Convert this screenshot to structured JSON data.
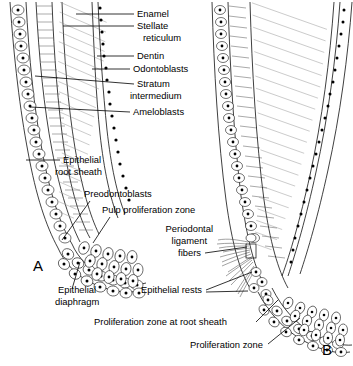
{
  "figure": {
    "background": "#ffffff",
    "ink": "#000000"
  },
  "panels": [
    {
      "id": "A",
      "label": "A",
      "x": 33,
      "y": 271
    },
    {
      "id": "B",
      "label": "B",
      "x": 322,
      "y": 355
    }
  ],
  "labels": [
    {
      "id": "enamel",
      "text": "Enamel",
      "x": 137,
      "y": 17,
      "anchor": "start"
    },
    {
      "id": "stellate",
      "text": "Stellate",
      "x": 137,
      "y": 29,
      "anchor": "start"
    },
    {
      "id": "reticulum",
      "text": "reticulum",
      "x": 143,
      "y": 41,
      "anchor": "start"
    },
    {
      "id": "dentin",
      "text": "Dentin",
      "x": 137,
      "y": 59,
      "anchor": "start"
    },
    {
      "id": "odontoblasts",
      "text": "Odontoblasts",
      "x": 133,
      "y": 72,
      "anchor": "start"
    },
    {
      "id": "stratum",
      "text": "Stratum",
      "x": 137,
      "y": 87,
      "anchor": "start"
    },
    {
      "id": "intermedium",
      "text": "intermedium",
      "x": 130,
      "y": 99,
      "anchor": "start"
    },
    {
      "id": "ameloblasts",
      "text": "Ameloblasts",
      "x": 133,
      "y": 115,
      "anchor": "start"
    },
    {
      "id": "epith-root-1",
      "text": "Epithelial",
      "x": 63,
      "y": 163,
      "anchor": "start"
    },
    {
      "id": "epith-root-2",
      "text": "root sheath",
      "x": 55,
      "y": 175,
      "anchor": "start"
    },
    {
      "id": "preodontoblasts",
      "text": "Preodontoblasts",
      "x": 84,
      "y": 197,
      "anchor": "start"
    },
    {
      "id": "pulp-prolif",
      "text": "Pulp proliferation zone",
      "x": 102,
      "y": 213,
      "anchor": "start"
    },
    {
      "id": "perio-1",
      "text": "Periodontal",
      "x": 213,
      "y": 232,
      "anchor": "end"
    },
    {
      "id": "perio-2",
      "text": "ligament",
      "x": 207,
      "y": 244,
      "anchor": "end"
    },
    {
      "id": "perio-3",
      "text": "fibers",
      "x": 201,
      "y": 256,
      "anchor": "end"
    },
    {
      "id": "epith-rests",
      "text": "Epithelial rests",
      "x": 141,
      "y": 293,
      "anchor": "start"
    },
    {
      "id": "prolif-root-sheath",
      "text": "Proliferation zone at root sheath",
      "x": 94,
      "y": 325,
      "anchor": "start"
    },
    {
      "id": "prolif-zone",
      "text": "Proliferation zone",
      "x": 190,
      "y": 348,
      "anchor": "start"
    },
    {
      "id": "epith-diaphragm-1",
      "text": "Epithelial",
      "x": 58,
      "y": 293,
      "anchor": "start"
    },
    {
      "id": "epith-diaphragm-2",
      "text": "diaphragm",
      "x": 55,
      "y": 305,
      "anchor": "start"
    }
  ],
  "leaders": [
    {
      "id": "ld-enamel",
      "d": "M134,14 L76,14"
    },
    {
      "id": "ld-stellate",
      "d": "M134,26 L63,26"
    },
    {
      "id": "ld-dentin",
      "d": "M134,56 L97,56"
    },
    {
      "id": "ld-odontoblasts",
      "d": "M130,69 L92,69"
    },
    {
      "id": "ld-stratum",
      "d": "M134,84 L35,76"
    },
    {
      "id": "ld-ameloblasts",
      "d": "M130,112 L30,107"
    },
    {
      "id": "ld-rootsheath",
      "d": "M60,160 L26,160"
    },
    {
      "id": "ld-preodonto",
      "d": "M90,201 L62,240"
    },
    {
      "id": "ld-pulp",
      "d": "M110,217 L93,243"
    },
    {
      "id": "ld-diaphragm",
      "d": "M72,289 L80,262"
    },
    {
      "id": "ld-perio",
      "d": "M205,253 L247,247"
    },
    {
      "id": "ld-rests-a",
      "d": "M206,290 L252,272"
    },
    {
      "id": "ld-rests-b",
      "d": "M206,292 L248,291"
    },
    {
      "id": "ld-prolif-sheath",
      "d": "M256,322 L278,300"
    },
    {
      "id": "ld-prolif-zone",
      "d": "M268,344 L300,318"
    }
  ],
  "structures": {
    "panel_a": {
      "name": "developing tooth root with epithelial diaphragm",
      "outer_sheath": "columnar cell layer",
      "inner_sheath": "cuboidal nucleated cell layer",
      "hard_tissue": "hatched enamel and dentin bands",
      "apex": "epithelial diaphragm hook with stacked oval cells"
    },
    "panel_b": {
      "name": "elongated root with periodontal ligament fibers",
      "fiber_count": 14,
      "epithelial_rests": "detached cell clusters along root surface",
      "apex": "proliferation zone with oval cell mass"
    }
  }
}
